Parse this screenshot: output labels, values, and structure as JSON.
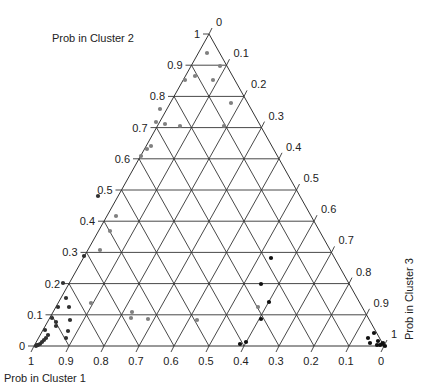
{
  "chart_data": {
    "type": "scatter",
    "subtype": "ternary",
    "title": "",
    "axes": {
      "a": {
        "label": "Prob in Cluster 1",
        "ticks": [
          "1",
          "0.9",
          "0.8",
          "0.7",
          "0.6",
          "0.5",
          "0.4",
          "0.3",
          "0.2",
          "0.1",
          "0"
        ]
      },
      "b": {
        "label": "Prob in Cluster 2",
        "ticks": [
          "0",
          "0.1",
          "0.2",
          "0.3",
          "0.4",
          "0.5",
          "0.6",
          "0.7",
          "0.8",
          "0.9",
          "1"
        ]
      },
      "c": {
        "label": "Prob in Cluster 3",
        "ticks": [
          "0",
          "0.1",
          "0.2",
          "0.3",
          "0.4",
          "0.5",
          "0.6",
          "0.7",
          "0.8",
          "0.9",
          "1"
        ]
      }
    },
    "grid": true,
    "grid_step": 0.1,
    "series": [
      {
        "name": "cluster-2-assigned",
        "color": "#808080",
        "points_px": [
          [
            185,
            80
          ],
          [
            195,
            76
          ],
          [
            213,
            80
          ],
          [
            220,
            66
          ],
          [
            207,
            53
          ],
          [
            231,
            103
          ],
          [
            160,
            109
          ],
          [
            156,
            122
          ],
          [
            165,
            124
          ],
          [
            180,
            126
          ],
          [
            224,
            126
          ],
          [
            147,
            149
          ],
          [
            151,
            146
          ],
          [
            141,
            156
          ],
          [
            116,
            216
          ],
          [
            110,
            231
          ],
          [
            100,
            250
          ],
          [
            132,
            312
          ],
          [
            91,
            303
          ],
          [
            131,
            318
          ],
          [
            148,
            319
          ],
          [
            197,
            320
          ],
          [
            258,
            307
          ]
        ]
      },
      {
        "name": "cluster-1-assigned",
        "color": "#303030",
        "points_px": [
          [
            98,
            196
          ],
          [
            84,
            256
          ],
          [
            63,
            283
          ],
          [
            66,
            298
          ],
          [
            69,
            307
          ],
          [
            58,
            307
          ],
          [
            48,
            335
          ],
          [
            46,
            338
          ],
          [
            44,
            340
          ],
          [
            42,
            342
          ],
          [
            40,
            344
          ],
          [
            38,
            345
          ],
          [
            36,
            346
          ],
          [
            45,
            330
          ],
          [
            56,
            326
          ],
          [
            56,
            322
          ],
          [
            52,
            318
          ],
          [
            66,
            338
          ],
          [
            68,
            331
          ],
          [
            70,
            320
          ],
          [
            37,
            345
          ]
        ]
      },
      {
        "name": "cluster-3-assigned",
        "color": "#101010",
        "points_px": [
          [
            261,
            284
          ],
          [
            269,
            302
          ],
          [
            261,
            319
          ],
          [
            240,
            344
          ],
          [
            246,
            342
          ],
          [
            374,
            333
          ],
          [
            368,
            338
          ],
          [
            370,
            343
          ],
          [
            378,
            341
          ],
          [
            382,
            344
          ],
          [
            380,
            345
          ],
          [
            377,
            345
          ],
          [
            385,
            346
          ],
          [
            383,
            343
          ],
          [
            271,
            258
          ]
        ]
      }
    ]
  }
}
